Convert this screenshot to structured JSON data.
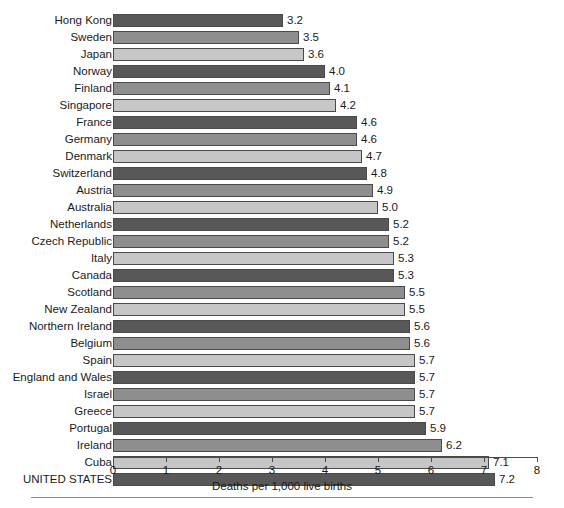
{
  "chart_data": {
    "type": "bar",
    "orientation": "horizontal",
    "title": "",
    "xlabel": "Deaths per 1,000 live births",
    "ylabel": "",
    "xlim": [
      0,
      8
    ],
    "xticks": [
      "0",
      "1",
      "2",
      "3",
      "4",
      "5",
      "6",
      "7",
      "8"
    ],
    "grid": false,
    "legend": null,
    "value_label_format": "one-decimal",
    "categories": [
      "Hong Kong",
      "Sweden",
      "Japan",
      "Norway",
      "Finland",
      "Singapore",
      "France",
      "Germany",
      "Denmark",
      "Switzerland",
      "Austria",
      "Australia",
      "Netherlands",
      "Czech Republic",
      "Italy",
      "Canada",
      "Scotland",
      "New Zealand",
      "Northern Ireland",
      "Belgium",
      "Spain",
      "England and Wales",
      "Israel",
      "Greece",
      "Portugal",
      "Ireland",
      "Cuba",
      "UNITED STATES"
    ],
    "values": [
      3.2,
      3.5,
      3.6,
      4.0,
      4.1,
      4.2,
      4.6,
      4.6,
      4.7,
      4.8,
      4.9,
      5.0,
      5.2,
      5.2,
      5.3,
      5.3,
      5.5,
      5.5,
      5.6,
      5.6,
      5.7,
      5.7,
      5.7,
      5.7,
      5.9,
      6.2,
      7.1,
      7.2
    ],
    "value_labels": [
      "3.2",
      "3.5",
      "3.6",
      "4.0",
      "4.1",
      "4.2",
      "4.6",
      "4.6",
      "4.7",
      "4.8",
      "4.9",
      "5.0",
      "5.2",
      "5.2",
      "5.3",
      "5.3",
      "5.5",
      "5.5",
      "5.6",
      "5.6",
      "5.7",
      "5.7",
      "5.7",
      "5.7",
      "5.9",
      "6.2",
      "7.1",
      "7.2"
    ],
    "colors": {
      "dark": "#585858",
      "medium": "#8e8e8e",
      "light": "#c6c6c6",
      "bar_outline": "#4a4a4a",
      "axis": "#4a4a4a",
      "text": "#1a1a1a",
      "background": "#ffffff"
    }
  }
}
